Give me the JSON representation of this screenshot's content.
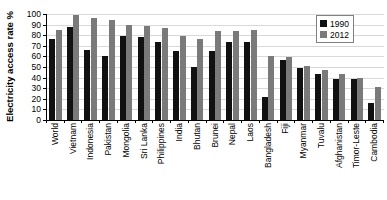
{
  "chart_data": {
    "type": "bar",
    "title": "",
    "xlabel": "",
    "ylabel": "Electricity access rate %",
    "ylim": [
      0,
      100
    ],
    "yticks": [
      0,
      10,
      20,
      30,
      40,
      50,
      60,
      70,
      80,
      90,
      100
    ],
    "grid": true,
    "legend_position": "top-right",
    "categories": [
      "World",
      "Vietnam",
      "Indonesia",
      "Pakistan",
      "Mongolia",
      "Sri Lanka",
      "Philippines",
      "India",
      "Bhutan",
      "Brunei",
      "Nepal",
      "Laos",
      "Bangladesh",
      "Fiji",
      "Myanmar",
      "Tuvalu",
      "Afghanistan",
      "Timor-Leste",
      "Cambodia"
    ],
    "series": [
      {
        "name": "1990",
        "color": "#111111",
        "values": [
          76,
          88,
          66,
          60,
          79,
          78,
          74,
          65,
          50,
          65,
          74,
          74,
          22,
          57,
          49,
          43,
          39,
          39,
          16
        ]
      },
      {
        "name": "2012",
        "color": "#7a7a7a",
        "values": [
          85,
          99,
          96,
          94,
          90,
          89,
          87,
          79,
          76,
          84,
          84,
          85,
          60,
          59,
          51,
          47,
          43,
          40,
          31
        ]
      }
    ]
  },
  "legend": {
    "entries": [
      {
        "label": "1990"
      },
      {
        "label": "2012"
      }
    ]
  }
}
